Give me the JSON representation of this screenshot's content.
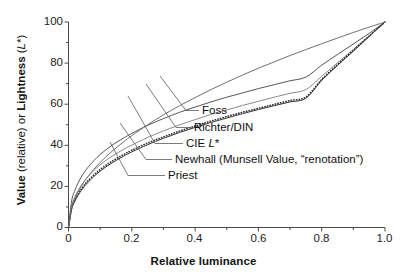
{
  "chart_data": {
    "type": "line",
    "title": "",
    "xlabel": "Relative luminance",
    "ylabel": "Value (relative) or Lightness (L*)",
    "ylabel_parts": {
      "bold_1": "Value",
      "plain_1": " (relative) or ",
      "bold_2": "Lightness",
      "plain_2": " (",
      "italic": "L",
      "plain_3": "*)"
    },
    "xlim": [
      0,
      1.0
    ],
    "ylim": [
      0,
      100
    ],
    "x_ticks": [
      "0",
      "0.2",
      "0.4",
      "0.6",
      "0.8",
      "1.0"
    ],
    "x_tick_values": [
      0,
      0.2,
      0.4,
      0.6,
      0.8,
      1.0
    ],
    "x_minor_step": 0.1,
    "y_ticks": [
      "0",
      "20",
      "40",
      "60",
      "80",
      "100"
    ],
    "y_tick_values": [
      0,
      20,
      40,
      60,
      80,
      100
    ],
    "y_minor_step": 10,
    "grid": false,
    "legend_position": "inline-annotations",
    "x": [
      0,
      0.01,
      0.02,
      0.03,
      0.04,
      0.05,
      0.06,
      0.08,
      0.1,
      0.125,
      0.15,
      0.175,
      0.2,
      0.25,
      0.3,
      0.35,
      0.4,
      0.45,
      0.5,
      0.55,
      0.6,
      0.65,
      0.7,
      0.75,
      0.8,
      0.85,
      0.9,
      0.95,
      1.0
    ],
    "series": [
      {
        "name": "Foss",
        "style": "solid",
        "color": "#555555",
        "values": [
          0,
          13.0,
          18.0,
          21.6,
          24.5,
          26.9,
          29.0,
          32.5,
          35.5,
          38.6,
          41.3,
          43.6,
          45.8,
          49.7,
          53.0,
          56.0,
          58.6,
          61.1,
          63.4,
          65.5,
          67.6,
          69.5,
          71.4,
          73.2,
          79.0,
          84.2,
          89.3,
          94.5,
          100
        ]
      },
      {
        "name": "Richter/DIN",
        "style": "solid",
        "color": "#8a8a8a",
        "values": [
          0,
          10.5,
          14.8,
          17.9,
          20.4,
          22.6,
          24.5,
          27.7,
          30.5,
          33.4,
          35.9,
          38.1,
          40.1,
          43.8,
          47.0,
          49.9,
          52.5,
          55.0,
          57.2,
          59.4,
          61.4,
          63.4,
          65.3,
          67.1,
          73.6,
          80.1,
          86.7,
          93.3,
          100
        ]
      },
      {
        "name": "CIE L*",
        "style": "solid",
        "color": "#333333",
        "values": [
          0,
          8.99,
          12.7,
          15.6,
          17.9,
          19.9,
          21.7,
          24.8,
          27.4,
          30.2,
          32.6,
          34.8,
          36.8,
          40.3,
          43.4,
          46.2,
          48.7,
          51.1,
          53.3,
          55.4,
          57.4,
          59.3,
          61.1,
          62.9,
          71.6,
          78.9,
          85.8,
          93.0,
          100
        ]
      },
      {
        "name": "Newhall (Munsell Value, “renotation”)",
        "style": "dotted",
        "color": "#333333",
        "values": [
          0,
          9.5,
          13.4,
          16.3,
          18.7,
          20.7,
          22.5,
          25.6,
          28.2,
          31.0,
          33.4,
          35.6,
          37.6,
          41.1,
          44.1,
          46.9,
          49.4,
          51.8,
          54.0,
          56.1,
          58.0,
          59.9,
          61.8,
          63.5,
          72.0,
          79.3,
          86.2,
          93.2,
          100
        ]
      },
      {
        "name": "Priest",
        "style": "solid",
        "color": "#707070",
        "values": [
          0,
          10.0,
          14.1,
          17.3,
          20.0,
          22.4,
          24.5,
          28.3,
          31.6,
          35.4,
          38.7,
          41.8,
          44.7,
          50.0,
          54.8,
          59.2,
          63.2,
          67.1,
          70.7,
          74.2,
          77.5,
          80.6,
          83.7,
          86.6,
          89.4,
          92.2,
          94.9,
          97.5,
          100
        ]
      }
    ],
    "annotations": [
      {
        "text": "Foss",
        "x_px": 202,
        "y_px": 112
      },
      {
        "text": "Richter/DIN",
        "x_px": 194,
        "y_px": 129
      },
      {
        "text": "CIE L*",
        "x_px": 186,
        "y_px": 145
      },
      {
        "text": "Newhall (Munsell Value, “renotation”)",
        "x_px": 175,
        "y_px": 161
      },
      {
        "text": "Priest",
        "x_px": 168,
        "y_px": 177
      }
    ]
  },
  "labels": {
    "foss": "Foss",
    "richter": "Richter/DIN",
    "cie_prefix": "CIE ",
    "cie_italic": "L",
    "cie_suffix": "*",
    "newhall": "Newhall (Munsell Value, “renotation”)",
    "priest": "Priest"
  },
  "axes": {
    "x_title": "Relative luminance",
    "y_bold_1": "Value",
    "y_plain_1": " (relative) or ",
    "y_bold_2": "Lightness",
    "y_plain_2": " (",
    "y_italic": "L",
    "y_plain_3": "*)"
  }
}
